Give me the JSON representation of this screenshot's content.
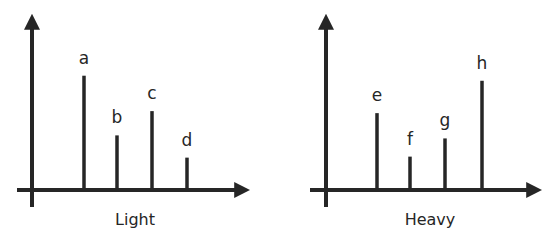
{
  "chart_data": [
    {
      "type": "bar",
      "title": "Light",
      "xlabel": "Light",
      "ylabel": "",
      "categories": [
        "a",
        "b",
        "c",
        "d"
      ],
      "values": [
        113,
        54,
        78,
        32
      ],
      "grid": false,
      "legend": null,
      "ylim": [
        0,
        175
      ],
      "geometry": {
        "origin_x": 32,
        "axis_y": 190,
        "x_start": 17,
        "x_end": 251,
        "y_top": 13,
        "y_bottom": 207,
        "bar_x": [
          84,
          117,
          152,
          187
        ],
        "label_x": 135
      }
    },
    {
      "type": "bar",
      "title": "Heavy",
      "xlabel": "Heavy",
      "ylabel": "",
      "categories": [
        "e",
        "f",
        "g",
        "h"
      ],
      "values": [
        76,
        33,
        51,
        108
      ],
      "grid": false,
      "legend": null,
      "ylim": [
        0,
        175
      ],
      "geometry": {
        "origin_x": 326,
        "axis_y": 190,
        "x_start": 310,
        "x_end": 543,
        "y_top": 13,
        "y_bottom": 207,
        "bar_x": [
          377,
          410,
          445,
          482
        ],
        "label_x": 430
      }
    }
  ],
  "colors": {
    "ink": "#262626",
    "background": "#ffffff"
  }
}
